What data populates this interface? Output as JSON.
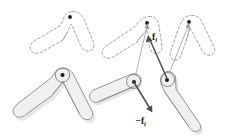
{
  "figure": {
    "background_color": "#ffffff",
    "width": 227,
    "height": 136
  },
  "panels": [
    {
      "id": "left-panel",
      "name": "single-body-panel",
      "description": "One two-link chevron body shown in a dashed reference pose above and a solid shaded pose below",
      "shapes": [
        {
          "name": "dashed-chevron-body",
          "style": "dashed-outline",
          "outline_color": "#9a9a9a",
          "fill_color": "#ffffff",
          "apex": [
            70,
            17
          ],
          "left_tip": [
            33,
            49
          ],
          "right_tip": [
            90,
            48
          ]
        },
        {
          "name": "solid-chevron-body",
          "style": "solid-filled",
          "outline_color": "#8a8a8a",
          "fill_color": "#f0f0f0",
          "apex": [
            62,
            74
          ],
          "left_tip": [
            20,
            113
          ],
          "right_tip": [
            90,
            118
          ]
        }
      ],
      "joints": [
        {
          "name": "joint-marker-dashed",
          "x": 70,
          "y": 17,
          "color": "#1a1a1a"
        },
        {
          "name": "joint-marker-solid",
          "x": 62,
          "y": 75,
          "color": "#1a1a1a"
        }
      ]
    },
    {
      "id": "right-panel",
      "name": "force-pair-panel",
      "description": "Two bodies with an equal and opposite force pair acting at their joints",
      "shapes": [
        {
          "name": "dashed-chevron-body-left",
          "style": "dashed-outline",
          "outline_color": "#9a9a9a",
          "fill_color": "#ffffff",
          "apex": [
            147,
            22
          ],
          "left_tip": [
            106,
            55
          ],
          "right_tip": [
            159,
            57
          ]
        },
        {
          "name": "dashed-chevron-body-right",
          "style": "dashed-outline",
          "outline_color": "#9a9a9a",
          "fill_color": "#ffffff",
          "apex": [
            189,
            21
          ],
          "left_tip": [
            176,
            58
          ],
          "right_tip": [
            219,
            54
          ]
        },
        {
          "name": "solid-link-body-left",
          "style": "solid-filled",
          "outline_color": "#8a8a8a",
          "fill_color": "#f0f0f0",
          "joint_end": [
            133,
            82
          ],
          "far_end": [
            97,
            104
          ]
        },
        {
          "name": "solid-link-body-right",
          "style": "solid-filled",
          "outline_color": "#8a8a8a",
          "fill_color": "#f0f0f0",
          "joint_end": [
            167,
            79
          ],
          "far_end": [
            199,
            128
          ]
        }
      ],
      "joints": [
        {
          "name": "joint-marker-dashed-left",
          "x": 147,
          "y": 23,
          "color": "#1a1a1a"
        },
        {
          "name": "joint-marker-dashed-right",
          "x": 189,
          "y": 22,
          "color": "#1a1a1a"
        },
        {
          "name": "joint-marker-solid-left",
          "x": 134,
          "y": 82,
          "color": "#1a1a1a"
        },
        {
          "name": "joint-marker-solid-right",
          "x": 167,
          "y": 80,
          "color": "#1a1a1a"
        }
      ],
      "vectors": [
        {
          "name": "force-vector-positive",
          "label": "f",
          "subscript": "i",
          "sign": "",
          "from": [
            167,
            79
          ],
          "to": [
            148,
            36
          ],
          "color": "#4d4d4d",
          "label_x": 152,
          "label_y": 40
        },
        {
          "name": "force-vector-negative",
          "label": "f",
          "subscript": "i",
          "sign": "−",
          "from": [
            134,
            82
          ],
          "to": [
            152,
            113
          ],
          "color": "#4d4d4d",
          "label_x": 136,
          "label_y": 124
        }
      ],
      "displacement_guides": [
        {
          "name": "displacement-guide-left",
          "from": [
            134,
            82
          ],
          "to": [
            147,
            24
          ],
          "color": "#9b9b9b"
        },
        {
          "name": "displacement-guide-right",
          "from": [
            167,
            79
          ],
          "to": [
            189,
            23
          ],
          "color": "#9b9b9b"
        }
      ]
    }
  ],
  "labels": {
    "force_positive": "f",
    "force_positive_subscript": "i",
    "force_negative_prefix": "−",
    "force_negative": "f",
    "force_negative_subscript": "i"
  },
  "colors": {
    "background": "#ffffff",
    "dashed_outline": "#9a9a9a",
    "solid_outline": "#8a8a8a",
    "solid_fill": "#f0f0f0",
    "shadow_fill": "#e3e3e3",
    "vector": "#4d4d4d",
    "guide": "#9b9b9b",
    "joint": "#1a1a1a",
    "text": "#111111"
  }
}
